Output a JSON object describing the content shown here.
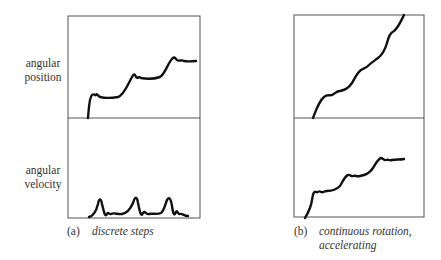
{
  "labels": {
    "position": [
      "angular",
      "position"
    ],
    "velocity": [
      "angular",
      "velocity"
    ]
  },
  "panels": [
    {
      "id": "a",
      "tag": "(a)",
      "caption": [
        "discrete steps"
      ]
    },
    {
      "id": "b",
      "tag": "(b)",
      "caption": [
        "continuous rotation,",
        "accelerating"
      ]
    }
  ],
  "colors": {
    "frame": "#555555",
    "curve": "#111111",
    "text": "#333333"
  }
}
